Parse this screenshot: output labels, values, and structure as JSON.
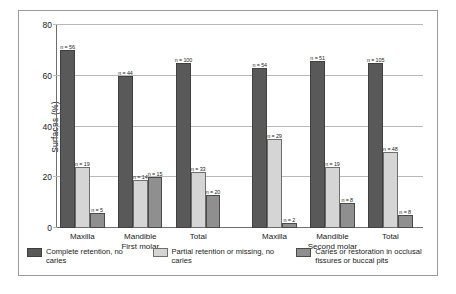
{
  "chart_data": {
    "type": "bar",
    "title": "",
    "subtitle": "",
    "xlabel": "",
    "ylabel": "Surfaces (%)",
    "ylim": [
      0,
      80
    ],
    "yticks": [
      "0",
      "20",
      "40",
      "60",
      "80"
    ],
    "ytick_values": [
      0,
      20,
      40,
      60,
      80
    ],
    "grid": true,
    "legend_position": "bottom",
    "group_labels": [
      "First molar",
      "Second molar"
    ],
    "categories": [
      "Maxilla",
      "Mandible",
      "Total",
      "Maxilla",
      "Mandible",
      "Total"
    ],
    "series": [
      {
        "name": "Complete retention, no caries",
        "color": "#595959",
        "values": [
          70,
          60,
          65,
          63,
          66,
          65
        ],
        "n_labels": [
          "n = 56",
          "n = 44",
          "n = 100",
          "n = 54",
          "n = 51",
          "n = 105"
        ]
      },
      {
        "name": "Partial retention or missing, no caries",
        "color": "#d5d5d5",
        "values": [
          24,
          19,
          22,
          35,
          24,
          30
        ],
        "n_labels": [
          "n = 19",
          "n = 14",
          "n = 33",
          "n = 29",
          "n = 19",
          "n = 48"
        ]
      },
      {
        "name": "Caries or restoration in occlusal fissures or buccal pits",
        "color": "#8f8f8f",
        "values": [
          6,
          20,
          13,
          2,
          10,
          5
        ],
        "n_labels": [
          "n = 5",
          "n = 15",
          "n = 20",
          "n = 2",
          "n = 8",
          "n = 8"
        ]
      }
    ]
  },
  "axis": {
    "y_title": "Surfaces (%)"
  },
  "groups": [
    {
      "label": "First molar",
      "categories": [
        {
          "label": "Maxilla",
          "bars": [
            {
              "series": 0,
              "value": 70,
              "n": "n = 56"
            },
            {
              "series": 1,
              "value": 24,
              "n": "n = 19"
            },
            {
              "series": 2,
              "value": 6,
              "n": "n = 5"
            }
          ]
        },
        {
          "label": "Mandible",
          "bars": [
            {
              "series": 0,
              "value": 60,
              "n": "n = 44"
            },
            {
              "series": 1,
              "value": 19,
              "n": "n = 14"
            },
            {
              "series": 2,
              "value": 20,
              "n": "n = 15"
            }
          ]
        },
        {
          "label": "Total",
          "bars": [
            {
              "series": 0,
              "value": 65,
              "n": "n = 100"
            },
            {
              "series": 1,
              "value": 22,
              "n": "n = 33"
            },
            {
              "series": 2,
              "value": 13,
              "n": "n = 20"
            }
          ]
        }
      ]
    },
    {
      "label": "Second molar",
      "categories": [
        {
          "label": "Maxilla",
          "bars": [
            {
              "series": 0,
              "value": 63,
              "n": "n = 54"
            },
            {
              "series": 1,
              "value": 35,
              "n": "n = 29"
            },
            {
              "series": 2,
              "value": 2,
              "n": "n = 2"
            }
          ]
        },
        {
          "label": "Mandible",
          "bars": [
            {
              "series": 0,
              "value": 66,
              "n": "n = 51"
            },
            {
              "series": 1,
              "value": 24,
              "n": "n = 19"
            },
            {
              "series": 2,
              "value": 10,
              "n": "n = 8"
            }
          ]
        },
        {
          "label": "Total",
          "bars": [
            {
              "series": 0,
              "value": 65,
              "n": "n = 105"
            },
            {
              "series": 1,
              "value": 30,
              "n": "n = 48"
            },
            {
              "series": 2,
              "value": 5,
              "n": "n = 8"
            }
          ]
        }
      ]
    }
  ],
  "legend": {
    "items": [
      {
        "label": "Complete retention, no caries",
        "color": "#595959"
      },
      {
        "label": "Partial retention or missing, no caries",
        "color": "#d5d5d5"
      },
      {
        "label": "Caries or restoration in occlusal fissures or buccal pits",
        "color": "#8f8f8f"
      }
    ]
  }
}
